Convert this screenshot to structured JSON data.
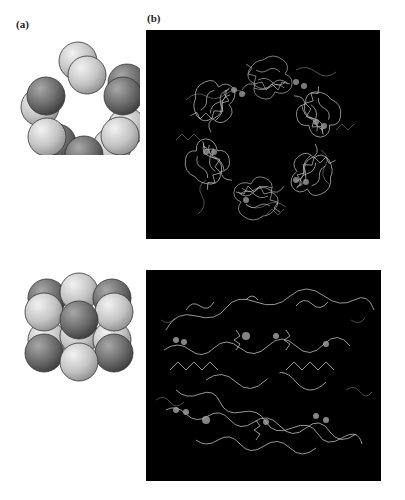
{
  "figure": {
    "panel_a": {
      "label": "(a)",
      "top_diagram": "hexameric ring of spheres (top view), alternating light and dark subunits",
      "bottom_diagram": "two stacked trimer layers of spheres (side view), alternating light and dark subunits"
    },
    "panel_b": {
      "label": "(b)",
      "top_image": "ribbon structure of hexameric protein complex, top view",
      "bottom_image": "ribbon structure of hexameric protein complex, side view"
    },
    "colors": {
      "sphere_light": "#c8c8c8",
      "sphere_dark": "#6f6f6f",
      "panel_background": "#000000",
      "ribbon": "#d8d8d8"
    }
  }
}
